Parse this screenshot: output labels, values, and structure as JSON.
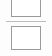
{
  "canvas": {
    "width": 52,
    "height": 56,
    "background_color": "#fdfdfd"
  },
  "theme": {
    "frame_border_color": "#9a9a9a",
    "frame_fill_color": "#ffffff",
    "divider_color": "#bcbcbc"
  },
  "frames": [
    {
      "name": "top-placeholder-frame",
      "label": "",
      "clipped": "top",
      "x": 11,
      "y": -9,
      "width": 30,
      "height": 26,
      "border_color": "#9a9a9a",
      "fill_color": "#ffffff"
    },
    {
      "name": "bottom-placeholder-frame",
      "label": "",
      "clipped": "none",
      "x": 11,
      "y": 26,
      "width": 30,
      "height": 24,
      "border_color": "#9a9a9a",
      "fill_color": "#ffffff"
    }
  ],
  "divider": {
    "name": "section-divider",
    "x": 6,
    "y": 21,
    "width": 40,
    "height": 1,
    "color": "#bcbcbc"
  }
}
